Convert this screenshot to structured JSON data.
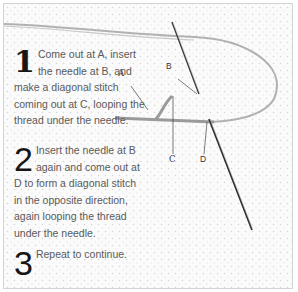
{
  "instructions": {
    "steps": [
      {
        "number": "1",
        "text": "Come out at A, insert the needle at B, and make a diagonal stitch coming out at C, looping the thread under the needle."
      },
      {
        "number": "2",
        "text": "Insert the needle at B again and come out at D to form a diagonal stitch in the opposite direction, again looping the thread under the needle."
      },
      {
        "number": "3",
        "text": "Repeat to continue."
      }
    ]
  },
  "illustration": {
    "labels": {
      "a": "A",
      "b": "B",
      "c": "C",
      "d": "D"
    },
    "colors": {
      "fabric": "#fbfbfb",
      "thread": "#9a9a9a",
      "needle": "#3a3a3a",
      "border": "#d4d4d4"
    }
  }
}
